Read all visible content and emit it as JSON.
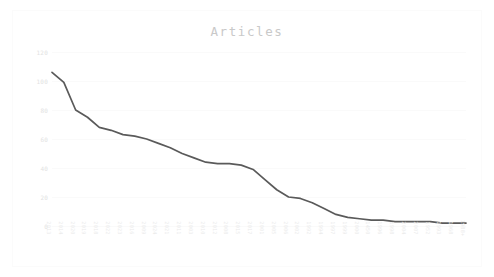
{
  "chart": {
    "title": "Articles",
    "title_color": "#c9c9c9",
    "line_color": "#5a5a5a",
    "grid_color": "#fafafa",
    "tick_label_color": "#e6e6e6",
    "background": "#ffffff"
  },
  "chart_data": {
    "type": "line",
    "title": "Articles",
    "xlabel": "",
    "ylabel": "",
    "ylim": [
      0,
      120
    ],
    "grid": true,
    "legend": "none",
    "y_ticks": [
      120,
      100,
      80,
      60,
      40,
      20,
      0
    ],
    "categories": [
      "2013",
      "2014",
      "2020",
      "2019",
      "2018",
      "2022",
      "2023",
      "2016",
      "2009",
      "2024",
      "2021",
      "2011",
      "2003",
      "2010",
      "2012",
      "2008",
      "2015",
      "2017",
      "2001",
      "2005",
      "2006",
      "2002",
      "1992",
      "1994",
      "1997",
      "1999",
      "2000",
      "1450",
      "1996",
      "1998",
      "2004",
      "2007",
      "1952",
      "1993",
      "1968",
      "1988+"
    ],
    "series": [
      {
        "name": "Articles",
        "values": [
          106,
          99,
          80,
          75,
          68,
          66,
          63,
          62,
          60,
          57,
          54,
          50,
          47,
          44,
          43,
          43,
          42,
          39,
          32,
          25,
          20,
          19,
          16,
          12,
          8,
          6,
          5,
          4,
          4,
          3,
          3,
          3,
          3,
          2,
          2,
          2
        ]
      }
    ]
  }
}
